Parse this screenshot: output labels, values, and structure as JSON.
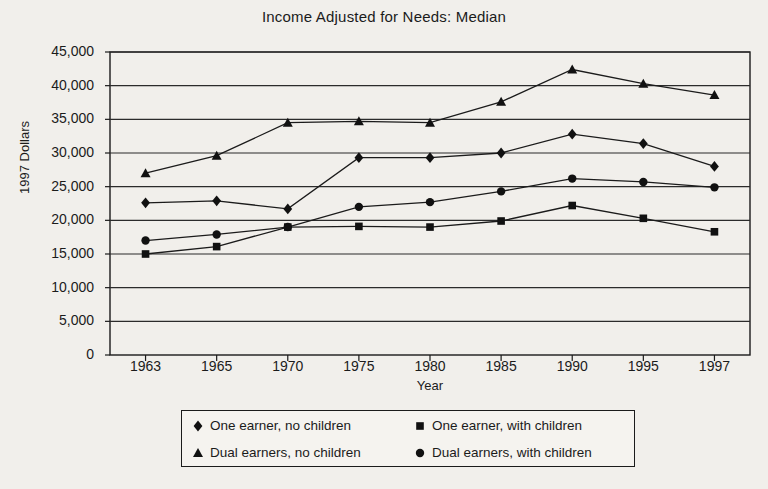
{
  "chart_data": {
    "type": "line",
    "title": "Income Adjusted for Needs: Median",
    "xlabel": "Year",
    "ylabel": "1997 Dollars",
    "categories": [
      "1963",
      "1965",
      "1970",
      "1975",
      "1980",
      "1985",
      "1990",
      "1995",
      "1997"
    ],
    "ylim": [
      0,
      45000
    ],
    "ytick_values": [
      0,
      5000,
      10000,
      15000,
      20000,
      25000,
      30000,
      35000,
      40000,
      45000
    ],
    "ytick_labels": [
      "0",
      "5,000",
      "10,000",
      "15,000",
      "20,000",
      "25,000",
      "30,000",
      "35,000",
      "40,000",
      "45,000"
    ],
    "grid": true,
    "grid_axis": "y",
    "legend_position": "bottom",
    "series": [
      {
        "name": "One earner, no children",
        "marker": "diamond",
        "values": [
          22600,
          22900,
          21700,
          29300,
          29300,
          30000,
          32800,
          31400,
          28000
        ]
      },
      {
        "name": "One earner, with children",
        "marker": "square",
        "values": [
          15000,
          16100,
          19000,
          19100,
          19000,
          19900,
          22200,
          20300,
          18300
        ]
      },
      {
        "name": "Dual earners, no children",
        "marker": "triangle",
        "values": [
          27000,
          29600,
          34500,
          34700,
          34500,
          37600,
          42400,
          40300,
          38600
        ]
      },
      {
        "name": "Dual earners, with children",
        "marker": "circle",
        "values": [
          17000,
          17900,
          19000,
          22000,
          22700,
          24300,
          26200,
          25700,
          24900
        ]
      }
    ],
    "colors": {
      "line": "#1b1b1b",
      "marker": "#111111",
      "grid": "#2b2b2b",
      "frame": "#1b1b1b",
      "background": "#f1efeb",
      "text": "#1b1b1b"
    }
  },
  "legend": {
    "items": [
      {
        "marker": "diamond",
        "label": "One earner, no children"
      },
      {
        "marker": "square",
        "label": "One earner, with children"
      },
      {
        "marker": "triangle",
        "label": "Dual earners, no children"
      },
      {
        "marker": "circle",
        "label": "Dual earners, with children"
      }
    ]
  }
}
